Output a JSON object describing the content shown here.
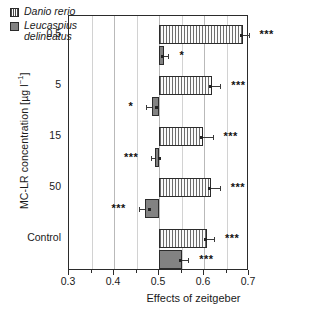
{
  "chart_data": {
    "type": "bar",
    "orientation": "horizontal",
    "title": "",
    "xlabel": "Effects of zeitgeber",
    "ylabel": "MC-LR concentration [µg l⁻¹]",
    "xlim": [
      0.3,
      0.7
    ],
    "xticks": [
      0.3,
      0.4,
      0.5,
      0.6,
      0.7
    ],
    "xticklabels": [
      "0.3",
      "0.4",
      "0.5",
      "0.6",
      "0.7"
    ],
    "xminorticks": [
      0.35,
      0.45,
      0.55,
      0.65
    ],
    "grid": "vertical",
    "baseline": 0.5,
    "legend_position": "top-left",
    "categories": [
      "0.5",
      "5",
      "15",
      "50",
      "Control"
    ],
    "series": [
      {
        "name": "Danio rerio",
        "pattern": "vertical-stripes",
        "values": [
          0.687,
          0.618,
          0.597,
          0.615,
          0.606
        ],
        "errors": [
          0.012,
          0.018,
          0.022,
          0.02,
          0.016
        ],
        "significance": [
          "***",
          "***",
          "***",
          "***",
          "***"
        ]
      },
      {
        "name": "Leucaspius delineatus",
        "pattern": "solid-gray",
        "values": [
          0.512,
          0.484,
          0.491,
          0.468,
          0.551
        ],
        "errors": [
          0.009,
          0.012,
          0.008,
          0.013,
          0.014
        ],
        "significance": [
          "*",
          "*",
          "***",
          "***",
          "***"
        ]
      }
    ]
  },
  "legend": {
    "items": [
      {
        "label": "Danio rerio",
        "label_line2": ""
      },
      {
        "label": "Leucaspius",
        "label_line2": "delineatus"
      }
    ]
  },
  "axis": {
    "x_title": "Effects of zeitgeber",
    "y_title_pre": "MC-LR concentration [µg l",
    "y_title_sup": "−1",
    "y_title_post": "]"
  }
}
